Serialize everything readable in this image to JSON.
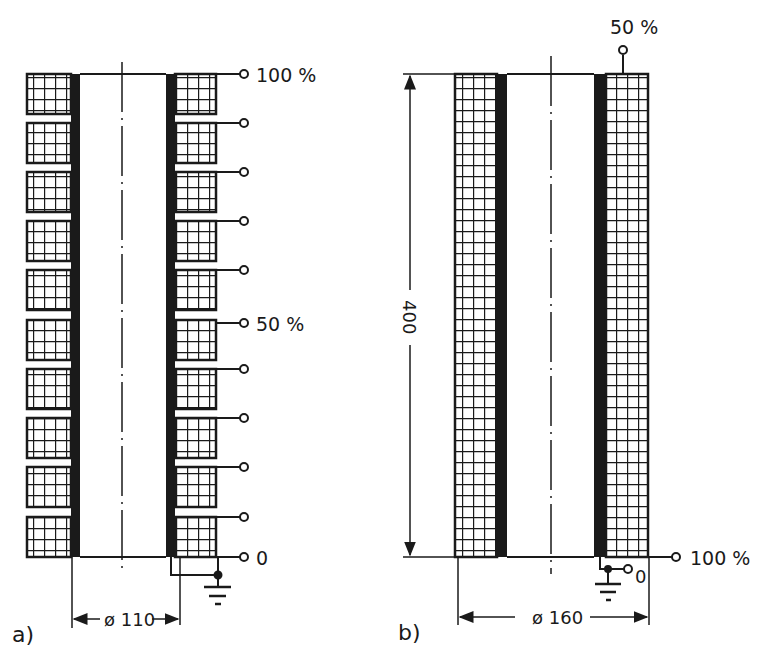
{
  "figure_a": {
    "label": "a)",
    "diameter": "ø 110",
    "taps": {
      "top": "100 %",
      "middle": "50 %",
      "bottom": "0"
    },
    "segments": 10
  },
  "figure_b": {
    "label": "b)",
    "diameter": "ø 160",
    "height": "400",
    "taps": {
      "top": "50 %",
      "bottom_outer": "100 %",
      "bottom_inner": "0"
    }
  },
  "colors": {
    "ink": "#1a1a1a",
    "background": "#ffffff"
  }
}
